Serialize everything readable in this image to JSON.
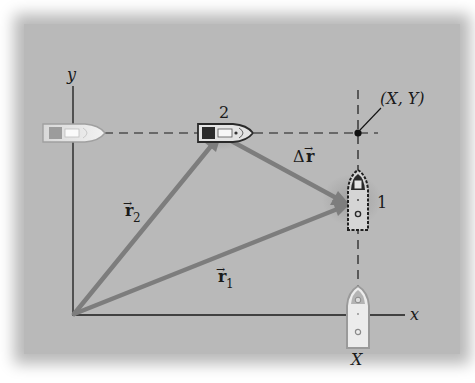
{
  "diagram": {
    "type": "position-vector diagram",
    "axes": {
      "x_label": "x",
      "y_label": "y"
    },
    "points": {
      "point_1_label": "1",
      "point_2_label": "2",
      "xy_point_label": "(X, Y)",
      "x_coordinate_label": "X"
    },
    "vectors": {
      "r1": {
        "symbol": "r",
        "subscript": "1",
        "arrow": "→"
      },
      "r2": {
        "symbol": "r",
        "subscript": "2",
        "arrow": "→"
      },
      "delta_r": {
        "delta": "Δ",
        "symbol": "r",
        "arrow": "→"
      }
    },
    "objects": [
      {
        "name": "boat-on-y-axis",
        "heading": "right"
      },
      {
        "name": "boat-at-position-2",
        "heading": "right"
      },
      {
        "name": "boat-at-position-1",
        "heading": "up"
      },
      {
        "name": "boat-on-x-axis",
        "heading": "up"
      }
    ],
    "colors": {
      "background": "#b9b9b9",
      "vector": "#7a7a7a",
      "axis": "#1a1a1a",
      "dashed": "#1a1a1a"
    }
  }
}
